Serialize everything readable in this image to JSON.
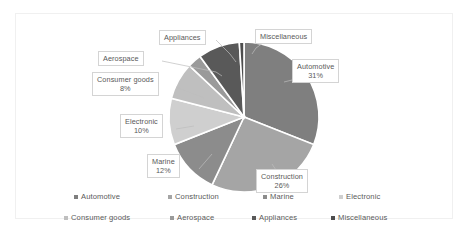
{
  "chart_data": {
    "type": "pie",
    "title": "",
    "subtitle": "",
    "xlabel": "",
    "ylabel": "",
    "grid": false,
    "legend_position": "bottom",
    "legend_columns": 4,
    "legend_rows": 2,
    "start_angle_deg": 0,
    "direction": "clockwise",
    "categories": [
      "Automotive",
      "Construction",
      "Marine",
      "Electronic",
      "Consumer goods",
      "Aerospace",
      "Appliances",
      "Miscellaneous"
    ],
    "values": [
      31,
      26,
      12,
      10,
      8,
      3,
      9,
      1
    ],
    "unit": "%",
    "colors": [
      "#7f7f7f",
      "#a5a5a5",
      "#8c8c8c",
      "#cfcfcf",
      "#bfbfbf",
      "#9a9a9a",
      "#595959",
      "#4d4d4d"
    ],
    "slice_border_color": "#ffffff",
    "slices": [
      {
        "label": "Automotive",
        "value": 31,
        "display": "31%",
        "color": "#7f7f7f"
      },
      {
        "label": "Construction",
        "value": 26,
        "display": "26%",
        "color": "#a5a5a5"
      },
      {
        "label": "Marine",
        "value": 12,
        "display": "12%",
        "color": "#8c8c8c"
      },
      {
        "label": "Electronic",
        "value": 10,
        "display": "10%",
        "color": "#cfcfcf"
      },
      {
        "label": "Consumer goods",
        "value": 8,
        "display": "8%",
        "color": "#bfbfbf"
      },
      {
        "label": "Aerospace",
        "value": 3,
        "display": "",
        "color": "#9a9a9a"
      },
      {
        "label": "Appliances",
        "value": 9,
        "display": "",
        "color": "#595959"
      },
      {
        "label": "Miscellaneous",
        "value": 1,
        "display": "",
        "color": "#4d4d4d"
      }
    ]
  },
  "callouts": [
    {
      "name": "automotive",
      "label": "Automotive",
      "pct": "31%"
    },
    {
      "name": "construction",
      "label": "Construction",
      "pct": "26%"
    },
    {
      "name": "marine",
      "label": "Marine",
      "pct": "12%"
    },
    {
      "name": "electronic",
      "label": "Electronic",
      "pct": "10%"
    },
    {
      "name": "consumer-goods",
      "label": "Consumer goods",
      "pct": "8%"
    },
    {
      "name": "aerospace",
      "label": "Aerospace",
      "pct": ""
    },
    {
      "name": "appliances",
      "label": "Appliances",
      "pct": ""
    },
    {
      "name": "miscellaneous",
      "label": "Miscellaneous",
      "pct": ""
    }
  ],
  "legend": {
    "row1": [
      {
        "label": "Automotive",
        "color": "#7f7f7f"
      },
      {
        "label": "Construction",
        "color": "#a5a5a5"
      },
      {
        "label": "Marine",
        "color": "#8c8c8c"
      },
      {
        "label": "Electronic",
        "color": "#cfcfcf"
      }
    ],
    "row2": [
      {
        "label": "Consumer goods",
        "color": "#bfbfbf"
      },
      {
        "label": "Aerospace",
        "color": "#9a9a9a"
      },
      {
        "label": "Appliances",
        "color": "#595959"
      },
      {
        "label": "Miscellaneous",
        "color": "#4d4d4d"
      }
    ]
  }
}
